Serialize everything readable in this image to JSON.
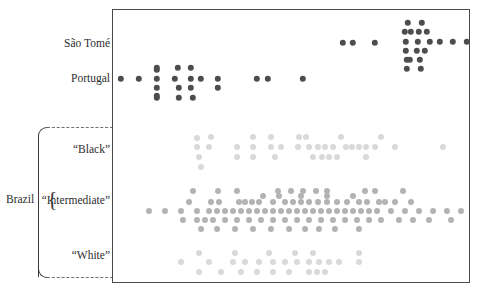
{
  "figure": {
    "type": "strip-plot",
    "background": "#ffffff",
    "frame_color": "#4a4a4a",
    "title": "",
    "xlabel": "",
    "ylabel": ""
  },
  "group_bracket": {
    "label": "Brazil",
    "brace_glyph": "{",
    "members": [
      "“Black”",
      "“Intermediate”",
      "“White”"
    ],
    "line_style": "dashed"
  },
  "categories": [
    {
      "key": "sao-tome",
      "label": "São Tomé",
      "color": "#4d4d4d",
      "dot_radius": 3.2
    },
    {
      "key": "portugal",
      "label": "Portugal",
      "color": "#4d4d4d",
      "dot_radius": 3.2
    },
    {
      "key": "black",
      "label": "“Black”",
      "color": "#d9d9d9",
      "dot_radius": 3.0
    },
    {
      "key": "intermediate",
      "label": "“Intermediate”",
      "color": "#b3b3b3",
      "dot_radius": 3.0
    },
    {
      "key": "white",
      "label": "“White”",
      "color": "#d9d9d9",
      "dot_radius": 3.0
    }
  ],
  "chart_data": {
    "type": "scatter",
    "title": "",
    "xlabel": "",
    "ylabel": "",
    "grid": false,
    "legend": "none",
    "xlim": [
      0,
      358
    ],
    "axis_note": "x positions are in plot-frame pixel units (0 = left frame edge, 358 = right frame edge); y positions are pixel offsets within the frame",
    "series": [
      {
        "name": "São Tomé",
        "color": "#4d4d4d",
        "points": [
          [
            230,
            33
          ],
          [
            240,
            33
          ],
          [
            262,
            33
          ],
          [
            295,
            13
          ],
          [
            309,
            13
          ],
          [
            292,
            22
          ],
          [
            298,
            22
          ],
          [
            306,
            22
          ],
          [
            314,
            22
          ],
          [
            293,
            32
          ],
          [
            305,
            32
          ],
          [
            317,
            32
          ],
          [
            327,
            32
          ],
          [
            340,
            32
          ],
          [
            354,
            32
          ],
          [
            293,
            41
          ],
          [
            304,
            41
          ],
          [
            312,
            41
          ],
          [
            294,
            50
          ],
          [
            297,
            50
          ],
          [
            307,
            50
          ],
          [
            294,
            59
          ],
          [
            308,
            59
          ]
        ]
      },
      {
        "name": "Portugal",
        "color": "#4d4d4d",
        "points": [
          [
            8,
            69
          ],
          [
            26,
            69
          ],
          [
            44,
            58
          ],
          [
            65,
            58
          ],
          [
            78,
            58
          ],
          [
            44,
            69
          ],
          [
            62,
            69
          ],
          [
            78,
            69
          ],
          [
            88,
            69
          ],
          [
            105,
            69
          ],
          [
            44,
            78
          ],
          [
            66,
            78
          ],
          [
            78,
            78
          ],
          [
            105,
            78
          ],
          [
            44,
            88
          ],
          [
            66,
            88
          ],
          [
            80,
            88
          ],
          [
            144,
            69
          ],
          [
            155,
            69
          ],
          [
            190,
            69
          ],
          [
            44,
            60
          ],
          [
            44,
            86
          ]
        ]
      },
      {
        "name": "“Black”",
        "color": "#d9d9d9",
        "points": [
          [
            84,
            128
          ],
          [
            98,
            127
          ],
          [
            140,
            127
          ],
          [
            158,
            127
          ],
          [
            186,
            127
          ],
          [
            193,
            127
          ],
          [
            228,
            127
          ],
          [
            268,
            127
          ],
          [
            84,
            137
          ],
          [
            96,
            137
          ],
          [
            124,
            137
          ],
          [
            140,
            137
          ],
          [
            158,
            137
          ],
          [
            168,
            137
          ],
          [
            185,
            137
          ],
          [
            196,
            137
          ],
          [
            205,
            137
          ],
          [
            212,
            137
          ],
          [
            220,
            137
          ],
          [
            233,
            137
          ],
          [
            239,
            137
          ],
          [
            246,
            137
          ],
          [
            253,
            137
          ],
          [
            262,
            137
          ],
          [
            282,
            137
          ],
          [
            330,
            137
          ],
          [
            86,
            147
          ],
          [
            124,
            147
          ],
          [
            140,
            147
          ],
          [
            162,
            147
          ],
          [
            200,
            147
          ],
          [
            209,
            147
          ],
          [
            216,
            147
          ],
          [
            224,
            147
          ],
          [
            253,
            147
          ],
          [
            88,
            157
          ]
        ]
      },
      {
        "name": "“Intermediate”",
        "color": "#b3b3b3",
        "points": [
          [
            80,
            181
          ],
          [
            105,
            181
          ],
          [
            124,
            181
          ],
          [
            165,
            181
          ],
          [
            178,
            181
          ],
          [
            190,
            181
          ],
          [
            203,
            181
          ],
          [
            214,
            181
          ],
          [
            252,
            181
          ],
          [
            262,
            181
          ],
          [
            76,
            192
          ],
          [
            98,
            192
          ],
          [
            106,
            192
          ],
          [
            126,
            192
          ],
          [
            132,
            192
          ],
          [
            139,
            192
          ],
          [
            146,
            192
          ],
          [
            160,
            192
          ],
          [
            172,
            192
          ],
          [
            180,
            192
          ],
          [
            188,
            192
          ],
          [
            196,
            192
          ],
          [
            205,
            192
          ],
          [
            214,
            192
          ],
          [
            224,
            192
          ],
          [
            234,
            192
          ],
          [
            246,
            192
          ],
          [
            254,
            192
          ],
          [
            266,
            192
          ],
          [
            36,
            201
          ],
          [
            52,
            201
          ],
          [
            68,
            201
          ],
          [
            84,
            201
          ],
          [
            96,
            201
          ],
          [
            104,
            201
          ],
          [
            112,
            201
          ],
          [
            120,
            201
          ],
          [
            128,
            201
          ],
          [
            136,
            201
          ],
          [
            144,
            201
          ],
          [
            152,
            201
          ],
          [
            160,
            201
          ],
          [
            168,
            201
          ],
          [
            176,
            201
          ],
          [
            184,
            201
          ],
          [
            192,
            201
          ],
          [
            200,
            201
          ],
          [
            208,
            201
          ],
          [
            216,
            201
          ],
          [
            224,
            201
          ],
          [
            232,
            201
          ],
          [
            240,
            201
          ],
          [
            248,
            201
          ],
          [
            256,
            201
          ],
          [
            264,
            201
          ],
          [
            278,
            201
          ],
          [
            292,
            201
          ],
          [
            306,
            201
          ],
          [
            320,
            201
          ],
          [
            334,
            201
          ],
          [
            348,
            201
          ],
          [
            70,
            210
          ],
          [
            84,
            210
          ],
          [
            92,
            210
          ],
          [
            100,
            210
          ],
          [
            112,
            210
          ],
          [
            124,
            210
          ],
          [
            136,
            210
          ],
          [
            148,
            210
          ],
          [
            160,
            210
          ],
          [
            172,
            210
          ],
          [
            184,
            210
          ],
          [
            196,
            210
          ],
          [
            208,
            210
          ],
          [
            220,
            210
          ],
          [
            232,
            210
          ],
          [
            244,
            210
          ],
          [
            256,
            210
          ],
          [
            268,
            210
          ],
          [
            286,
            210
          ],
          [
            300,
            210
          ],
          [
            316,
            210
          ],
          [
            338,
            210
          ],
          [
            88,
            219
          ],
          [
            104,
            219
          ],
          [
            122,
            219
          ],
          [
            140,
            219
          ],
          [
            158,
            219
          ],
          [
            176,
            219
          ],
          [
            192,
            219
          ],
          [
            206,
            219
          ],
          [
            222,
            219
          ],
          [
            246,
            219
          ],
          [
            272,
            192
          ],
          [
            282,
            192
          ],
          [
            290,
            181
          ],
          [
            298,
            192
          ],
          [
            240,
            186
          ],
          [
            214,
            186
          ],
          [
            188,
            186
          ],
          [
            166,
            186
          ],
          [
            150,
            186
          ]
        ]
      },
      {
        "name": "“White”",
        "color": "#d9d9d9",
        "points": [
          [
            86,
            243
          ],
          [
            122,
            243
          ],
          [
            156,
            243
          ],
          [
            182,
            243
          ],
          [
            200,
            243
          ],
          [
            246,
            243
          ],
          [
            68,
            252
          ],
          [
            96,
            252
          ],
          [
            120,
            252
          ],
          [
            132,
            252
          ],
          [
            146,
            252
          ],
          [
            160,
            252
          ],
          [
            172,
            252
          ],
          [
            184,
            252
          ],
          [
            196,
            252
          ],
          [
            206,
            252
          ],
          [
            216,
            252
          ],
          [
            226,
            252
          ],
          [
            246,
            252
          ],
          [
            86,
            262
          ],
          [
            108,
            262
          ],
          [
            128,
            262
          ],
          [
            144,
            262
          ],
          [
            160,
            262
          ],
          [
            176,
            262
          ],
          [
            196,
            262
          ],
          [
            204,
            262
          ],
          [
            212,
            262
          ]
        ]
      }
    ]
  }
}
